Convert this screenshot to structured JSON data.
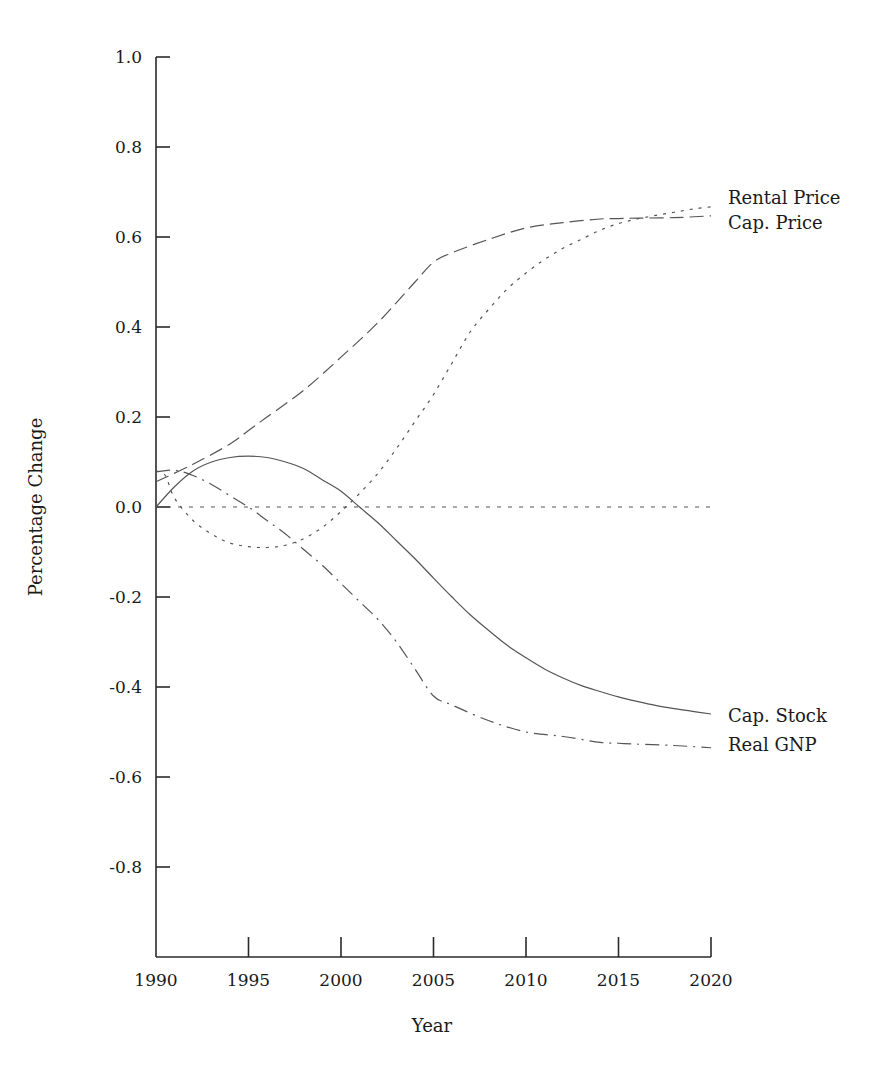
{
  "chart_data": {
    "type": "line",
    "title": "",
    "xlabel": "Year",
    "ylabel": "Percentage Change",
    "xlim": [
      1990,
      2020
    ],
    "ylim": [
      -1.0,
      1.0
    ],
    "grid": false,
    "legend_position": "inline-right",
    "x_ticks": [
      1990,
      1995,
      2000,
      2005,
      2010,
      2015,
      2020
    ],
    "x_tick_labels": [
      "1990",
      "1995",
      "2000",
      "2005",
      "2010",
      "2015",
      "2020"
    ],
    "y_ticks": [
      1.0,
      0.8,
      0.6,
      0.4,
      0.2,
      0.0,
      -0.2,
      -0.4,
      -0.6,
      -0.8
    ],
    "y_tick_labels": [
      "1.0",
      "0.8",
      "0.6",
      "0.4",
      "0.2",
      "0.0",
      "-0.2",
      "-0.4",
      "-0.6",
      "-0.8"
    ],
    "series": [
      {
        "name": "Rental Price",
        "style": "dotted",
        "x": [
          1990,
          1990.5,
          1991,
          1992,
          1993,
          1994,
          1995,
          1996,
          1997,
          1998,
          1999,
          2000,
          2001,
          2002,
          2003,
          2004,
          2005,
          2006,
          2007,
          2008,
          2009,
          2010,
          2011,
          2012,
          2013,
          2014,
          2015,
          2016,
          2017,
          2018,
          2019,
          2020
        ],
        "values": [
          0.08,
          0.07,
          0.02,
          -0.03,
          -0.06,
          -0.08,
          -0.088,
          -0.09,
          -0.085,
          -0.07,
          -0.045,
          -0.01,
          0.03,
          0.075,
          0.13,
          0.19,
          0.25,
          0.32,
          0.39,
          0.44,
          0.485,
          0.52,
          0.55,
          0.575,
          0.595,
          0.615,
          0.63,
          0.64,
          0.648,
          0.655,
          0.662,
          0.667
        ]
      },
      {
        "name": "Cap. Price",
        "style": "long-dash",
        "x": [
          1990,
          1992,
          1994,
          1995,
          1996,
          1998,
          2000,
          2002,
          2004,
          2005,
          2006,
          2008,
          2010,
          2012,
          2014,
          2015,
          2016,
          2018,
          2020
        ],
        "values": [
          0.056,
          0.095,
          0.14,
          0.17,
          0.2,
          0.26,
          0.333,
          0.41,
          0.5,
          0.544,
          0.565,
          0.595,
          0.62,
          0.632,
          0.64,
          0.641,
          0.642,
          0.643,
          0.647
        ]
      },
      {
        "name": "Cap. Stock",
        "style": "solid",
        "x": [
          1990,
          1991,
          1992,
          1993,
          1994,
          1995,
          1996,
          1997,
          1998,
          1999,
          2000,
          2001,
          2002,
          2003,
          2004,
          2005,
          2006,
          2007,
          2008,
          2009,
          2010,
          2011,
          2012,
          2013,
          2014,
          2015,
          2016,
          2017,
          2018,
          2019,
          2020
        ],
        "values": [
          0.0,
          0.045,
          0.08,
          0.1,
          0.11,
          0.113,
          0.11,
          0.1,
          0.085,
          0.06,
          0.035,
          0.0,
          -0.035,
          -0.075,
          -0.115,
          -0.158,
          -0.2,
          -0.24,
          -0.275,
          -0.308,
          -0.335,
          -0.36,
          -0.38,
          -0.397,
          -0.41,
          -0.422,
          -0.432,
          -0.441,
          -0.448,
          -0.454,
          -0.46
        ]
      },
      {
        "name": "Real GNP",
        "style": "dash-dot",
        "x": [
          1990,
          1991,
          1992,
          1993,
          1994,
          1995,
          1996,
          1997,
          1998,
          1999,
          2000,
          2001,
          2002,
          2003,
          2004,
          2005,
          2006,
          2008,
          2010,
          2012,
          2014,
          2015,
          2016,
          2018,
          2020
        ],
        "values": [
          0.078,
          0.082,
          0.07,
          0.05,
          0.025,
          0.0,
          -0.03,
          -0.06,
          -0.095,
          -0.13,
          -0.17,
          -0.21,
          -0.25,
          -0.3,
          -0.36,
          -0.42,
          -0.44,
          -0.475,
          -0.5,
          -0.51,
          -0.523,
          -0.525,
          -0.527,
          -0.53,
          -0.535
        ]
      },
      {
        "name": "Zero reference",
        "style": "short-dash",
        "x": [
          1990,
          2020
        ],
        "values": [
          0.0,
          0.0
        ]
      }
    ]
  },
  "labels": {
    "rental_price": "Rental Price",
    "cap_price": "Cap. Price",
    "cap_stock": "Cap. Stock",
    "real_gnp": "Real GNP",
    "xlabel": "Year",
    "ylabel": "Percentage Change"
  },
  "colors": {
    "axis": "#2a2a2a",
    "line": "#555555",
    "text": "#1a1a1a"
  }
}
